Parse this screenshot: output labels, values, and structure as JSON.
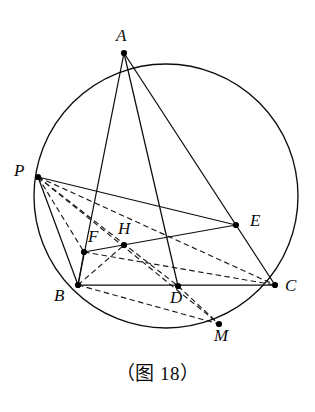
{
  "figure": {
    "caption": "（图 18）",
    "circle": {
      "cx": 166,
      "cy": 196,
      "r": 132,
      "color": "#0d0d0d"
    },
    "points": [
      {
        "id": "A",
        "label": "A",
        "x": 124,
        "y": 53,
        "label_x": 116,
        "label_y": 27
      },
      {
        "id": "P",
        "label": "P",
        "x": 38,
        "y": 177,
        "label_x": 14,
        "label_y": 162
      },
      {
        "id": "E",
        "label": "E",
        "x": 236,
        "y": 225,
        "label_x": 250,
        "label_y": 212
      },
      {
        "id": "F",
        "label": "F",
        "x": 84,
        "y": 252,
        "label_x": 88,
        "label_y": 228
      },
      {
        "id": "H",
        "label": "H",
        "x": 124,
        "y": 245,
        "label_x": 118,
        "label_y": 220
      },
      {
        "id": "B",
        "label": "B",
        "x": 78,
        "y": 285,
        "label_x": 54,
        "label_y": 287
      },
      {
        "id": "D",
        "label": "D",
        "x": 178,
        "y": 286,
        "label_x": 170,
        "label_y": 289
      },
      {
        "id": "C",
        "label": "C",
        "x": 275,
        "y": 285,
        "label_x": 285,
        "label_y": 277
      },
      {
        "id": "M",
        "label": "M",
        "x": 219,
        "y": 324,
        "label_x": 214,
        "label_y": 327
      }
    ],
    "solid_segments": [
      {
        "name": "segment-A-B",
        "from": "A",
        "to": "B"
      },
      {
        "name": "segment-A-C",
        "from": "A",
        "to": "C"
      },
      {
        "name": "segment-A-D",
        "from": "A",
        "to": "D"
      },
      {
        "name": "segment-P-B",
        "from": "P",
        "to": "B"
      },
      {
        "name": "segment-P-E",
        "from": "P",
        "to": "E"
      },
      {
        "name": "segment-F-E",
        "from": "F",
        "to": "E"
      },
      {
        "name": "segment-B-F",
        "from": "B",
        "to": "F"
      },
      {
        "name": "segment-B-C",
        "from": "B",
        "to": "C"
      }
    ],
    "dashed_segments": [
      {
        "name": "segment-P-C",
        "from": "P",
        "to": "C"
      },
      {
        "name": "segment-P-M",
        "from": "P",
        "to": "M"
      },
      {
        "name": "segment-P-D",
        "from": "P",
        "to": "D"
      },
      {
        "name": "segment-P-F",
        "from": "P",
        "to": "F"
      },
      {
        "name": "segment-F-C",
        "from": "F",
        "to": "C"
      },
      {
        "name": "segment-B-M",
        "from": "B",
        "to": "M"
      },
      {
        "name": "segment-D-M",
        "from": "D",
        "to": "M"
      },
      {
        "name": "segment-B-H",
        "from": "B",
        "to": "H"
      }
    ],
    "dot_radius": 3.1
  }
}
